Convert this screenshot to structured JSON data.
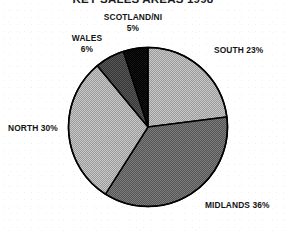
{
  "chart_data": {
    "type": "pie",
    "title": "KEY SALES AREAS 1998",
    "xlabel": "",
    "ylabel": "",
    "legend_position": "none",
    "grid": false,
    "categories": [
      "SOUTH",
      "MIDLANDS",
      "NORTH",
      "WALES",
      "SCOTLAND/NI"
    ],
    "values": [
      23,
      36,
      30,
      6,
      5
    ],
    "value_unit": "%",
    "start_angle_deg": 0,
    "direction": "clockwise",
    "slices": [
      {
        "name": "SOUTH",
        "value": 23,
        "label": "SOUTH 23%",
        "fill": "#b4b4b4",
        "pattern": "light-gray-halftone"
      },
      {
        "name": "MIDLANDS",
        "value": 36,
        "label": "MIDLANDS 36%",
        "fill": "#6e6e6e",
        "pattern": "medium-dark-halftone"
      },
      {
        "name": "NORTH",
        "value": 30,
        "label": "NORTH 30%",
        "fill": "#b4b4b4",
        "pattern": "light-gray-halftone"
      },
      {
        "name": "WALES",
        "value": 6,
        "label_line1": "WALES",
        "label_line2": "6%",
        "label": "WALES 6%",
        "fill": "#4a4a4a",
        "pattern": "dark-gray-halftone"
      },
      {
        "name": "SCOTLAND/NI",
        "value": 5,
        "label_line1": "SCOTLAND/NI",
        "label_line2": "5%",
        "label": "SCOTLAND/NI 5%",
        "fill": "#111111",
        "pattern": "solid-black"
      }
    ],
    "total": 100,
    "outline_color": "#000000"
  }
}
